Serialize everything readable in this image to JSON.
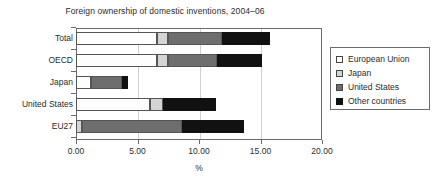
{
  "chart_data": {
    "type": "bar",
    "orientation": "horizontal",
    "stacked": true,
    "title": "Foreign ownership of domestic inventions, 2004–06",
    "xlabel": "%",
    "ylabel": "",
    "xlim": [
      0.0,
      20.0
    ],
    "xticks": [
      0.0,
      5.0,
      10.0,
      15.0,
      20.0
    ],
    "xtick_labels": [
      "0.00",
      "5.00",
      "10.00",
      "15.00",
      "20.00"
    ],
    "grid": true,
    "grid_axis": "x",
    "legend_position": "right",
    "categories": [
      "Total",
      "OECD",
      "Japan",
      "United States",
      "EU27"
    ],
    "series": [
      {
        "name": "European Union",
        "color": "#ffffff",
        "values": [
          6.6,
          6.6,
          1.2,
          6.0,
          0.0
        ]
      },
      {
        "name": "Japan",
        "color": "#d4d4d4",
        "values": [
          0.9,
          0.9,
          0.0,
          1.1,
          0.5
        ]
      },
      {
        "name": "United States",
        "color": "#6e6e6e",
        "values": [
          4.4,
          4.0,
          2.5,
          0.0,
          8.1
        ]
      },
      {
        "name": "Other countries",
        "color": "#111111",
        "values": [
          3.9,
          3.6,
          0.5,
          4.3,
          5.1
        ]
      }
    ],
    "totals": [
      15.8,
      15.1,
      4.2,
      11.4,
      13.7
    ]
  },
  "legend": {
    "items": [
      {
        "label": "European Union",
        "swatch": "eu"
      },
      {
        "label": "Japan",
        "swatch": "jp"
      },
      {
        "label": "United States",
        "swatch": "us"
      },
      {
        "label": "Other countries",
        "swatch": "oth"
      }
    ]
  }
}
